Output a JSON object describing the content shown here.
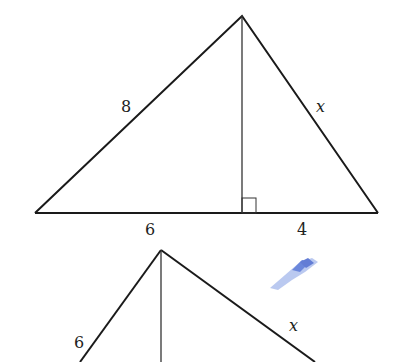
{
  "figure1": {
    "type": "triangle-with-altitude",
    "labels": {
      "left_side": "8",
      "right_side": "x",
      "base_left": "6",
      "base_right": "4"
    },
    "right_angle_marker": true
  },
  "figure2": {
    "type": "triangle-with-altitude-partial",
    "labels": {
      "left_side": "6",
      "right_side": "x"
    }
  },
  "colors": {
    "line": "#1a1a1a",
    "smudge": "#4a6fd8"
  }
}
